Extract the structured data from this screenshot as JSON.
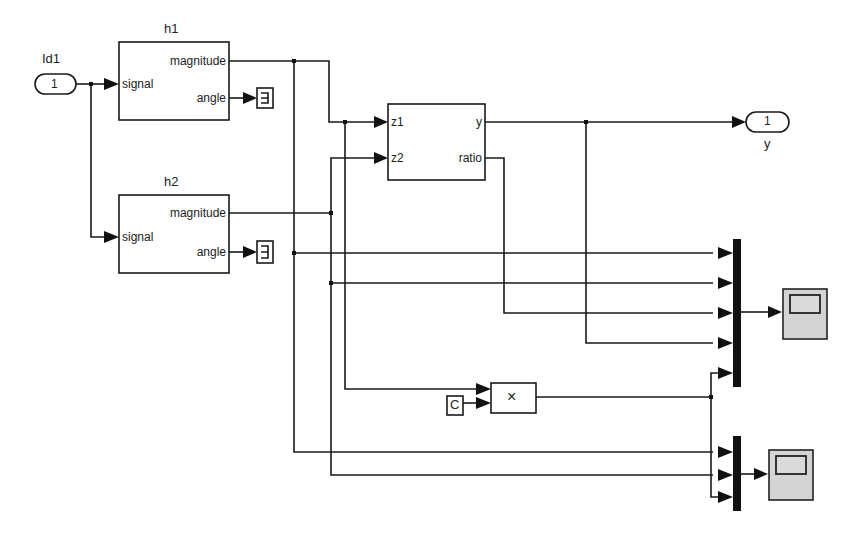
{
  "diagram": {
    "inport": {
      "name": "Id1",
      "number": "1"
    },
    "outport": {
      "name": "y",
      "number": "1"
    },
    "blocks": {
      "h1": {
        "title": "h1",
        "inputs": [
          "signal"
        ],
        "outputs": [
          "magnitude",
          "angle"
        ]
      },
      "h2": {
        "title": "h2",
        "inputs": [
          "signal"
        ],
        "outputs": [
          "magnitude",
          "angle"
        ]
      },
      "calc": {
        "title": "",
        "inputs": [
          "z1",
          "z2"
        ],
        "outputs": [
          "y",
          "ratio"
        ]
      },
      "product": {
        "symbol": "×"
      },
      "constant": {
        "symbol": "C"
      },
      "terminator_h1": {
        "symbol": "⊐"
      },
      "terminator_h2": {
        "symbol": "⊐"
      },
      "mux1": {
        "inputs": 5
      },
      "mux2": {
        "inputs": 3
      },
      "scope1": {
        "icon": "scope-icon"
      },
      "scope2": {
        "icon": "scope-icon"
      }
    },
    "colors": {
      "line": "#1a1a1a",
      "scope_fill": "#d4d4d4",
      "background": "#ffffff"
    }
  }
}
